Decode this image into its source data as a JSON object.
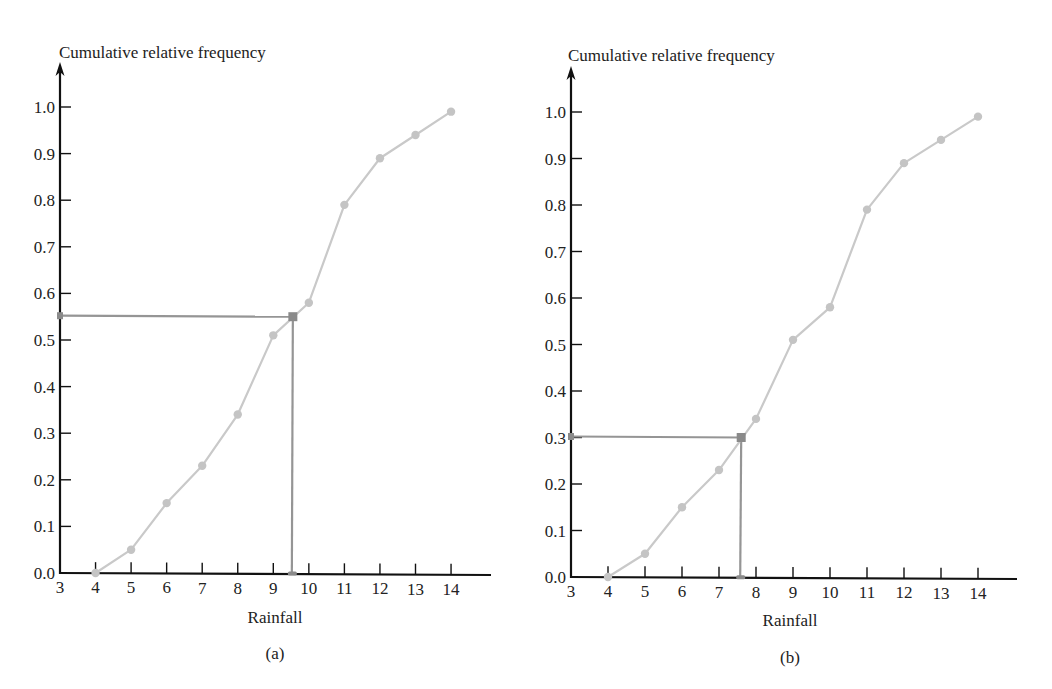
{
  "figure": {
    "panels": [
      {
        "id": "a",
        "caption": "(a)",
        "y_axis_title": "Cumulative relative frequency",
        "x_axis_title": "Rainfall",
        "layout": {
          "origin_x": 60,
          "origin_y": 573,
          "x_min": 3,
          "px_per_x": 35.55,
          "px_per_y": 466,
          "y_axis_top": 62,
          "x_axis_end": 491,
          "title_x": 59,
          "title_y": 58,
          "xlabel_cx": 275,
          "xlabel_y": 623,
          "caption_cx": 275,
          "caption_y": 659
        }
      },
      {
        "id": "b",
        "caption": "(b)",
        "y_axis_title": "Cumulative relative frequency",
        "x_axis_title": "Rainfall",
        "layout": {
          "origin_x": 571,
          "origin_y": 577,
          "x_min": 3,
          "px_per_x": 37,
          "px_per_y": 465,
          "y_axis_top": 66,
          "x_axis_end": 1017,
          "title_x": 568,
          "title_y": 61,
          "xlabel_cx": 790,
          "xlabel_y": 626,
          "caption_cx": 790,
          "caption_y": 663
        }
      }
    ],
    "colors": {
      "axis": "#111111",
      "curve": "#c9c9c9",
      "point": "#c4c4c4",
      "guide": "#959595",
      "marker": "#8a8a8a",
      "text": "#222222"
    }
  },
  "chart_data": [
    {
      "type": "line",
      "panel": "(a)",
      "title": "",
      "xlabel": "Rainfall",
      "ylabel": "Cumulative relative frequency",
      "x_ticks": [
        "3",
        "4",
        "5",
        "6",
        "7",
        "8",
        "9",
        "10",
        "11",
        "12",
        "13",
        "14"
      ],
      "y_ticks": [
        "0.0",
        "0.1",
        "0.2",
        "0.3",
        "0.4",
        "0.5",
        "0.6",
        "0.7",
        "0.8",
        "0.9",
        "1.0"
      ],
      "xlim": [
        3,
        15
      ],
      "ylim": [
        0,
        1.0
      ],
      "grid": false,
      "series": [
        {
          "name": "Cumulative relative frequency (ogive)",
          "x": [
            4,
            5,
            6,
            7,
            8,
            9,
            10,
            11,
            12,
            13,
            14
          ],
          "y": [
            0.0,
            0.05,
            0.15,
            0.23,
            0.34,
            0.51,
            0.58,
            0.79,
            0.89,
            0.94,
            0.99
          ]
        }
      ],
      "annotations": [
        {
          "type": "percentile_lookup",
          "y": 0.55,
          "x": 9.55,
          "description": "Horizontal line from y-axis at 0.55 to curve, then vertical line down to x-axis at about 9.55"
        }
      ]
    },
    {
      "type": "line",
      "panel": "(b)",
      "title": "",
      "xlabel": "Rainfall",
      "ylabel": "Cumulative relative frequency",
      "x_ticks": [
        "3",
        "4",
        "5",
        "6",
        "7",
        "8",
        "9",
        "10",
        "11",
        "12",
        "13",
        "14"
      ],
      "y_ticks": [
        "0.0",
        "0.1",
        "0.2",
        "0.3",
        "0.4",
        "0.5",
        "0.6",
        "0.7",
        "0.8",
        "0.9",
        "1.0"
      ],
      "xlim": [
        3,
        15
      ],
      "ylim": [
        0,
        1.0
      ],
      "grid": false,
      "series": [
        {
          "name": "Cumulative relative frequency (ogive)",
          "x": [
            4,
            5,
            6,
            7,
            8,
            9,
            10,
            11,
            12,
            13,
            14
          ],
          "y": [
            0.0,
            0.05,
            0.15,
            0.23,
            0.34,
            0.51,
            0.58,
            0.79,
            0.89,
            0.94,
            0.99
          ]
        }
      ],
      "annotations": [
        {
          "type": "percentile_lookup",
          "y": 0.3,
          "x": 7.6,
          "description": "Horizontal line from y-axis at 0.30 to curve, then vertical line down to x-axis at about 7.6"
        }
      ]
    }
  ]
}
